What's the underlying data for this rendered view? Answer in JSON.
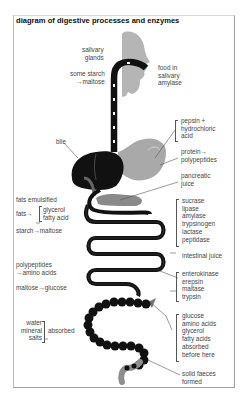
{
  "title": "diagram of digestive processes and enzymes",
  "labels": {
    "salivary_glands": [
      "salivary",
      "glands"
    ],
    "some_starch": [
      "some starch",
      "→maltose"
    ],
    "food_in_saliva": [
      "food in",
      "salivary",
      "amylase"
    ],
    "bile": "bile",
    "stomach_enzymes": [
      "pepsin +",
      "hydrochloric",
      "acid"
    ],
    "protein": [
      "protein→",
      "polypeptides"
    ],
    "pancreatic_juice": [
      "pancreatic",
      "juice"
    ],
    "fats_emulsified": "fats emulsified",
    "fats_arrow": "fats→",
    "fats_products": [
      "glycerol",
      "fatty acid"
    ],
    "starch_maltose": "starch→maltose",
    "pancreatic_enzymes": [
      "sucrase",
      "lipase",
      "amylase",
      "trypsinogen",
      "lactase",
      "peptidase"
    ],
    "intestinal_juice": "intestinal juice",
    "polypeptides": [
      "polypeptides",
      "→amino acids"
    ],
    "maltose_glucose": "maltose→glucose",
    "intestinal_enzymes": [
      "enterokinase",
      "erepsin",
      "maltase",
      "trypsin"
    ],
    "absorbed_items": [
      "water",
      "mineral",
      "salts"
    ],
    "absorbed": "absorbed",
    "absorbed_before": [
      "glucose",
      "amino acids",
      "glycerol",
      "fatty acids",
      "absorbed",
      "before here"
    ],
    "faeces": [
      "solid faeces",
      "formed"
    ]
  },
  "colors": {
    "organ_dark": "#111111",
    "organ_grey": "#a8a8a8",
    "head_grey": "#b5b5b5",
    "text": "#444444",
    "frame": "#9e9e9e"
  }
}
